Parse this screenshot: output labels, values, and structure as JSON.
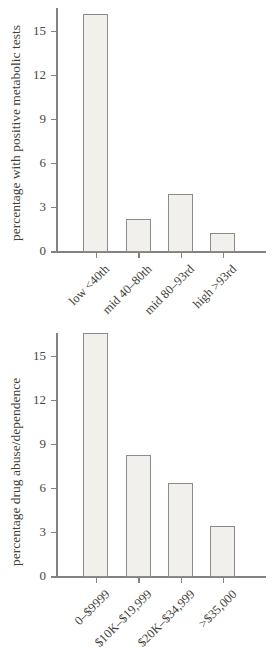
{
  "figure": {
    "background": "#ffffff",
    "text_color": "#413e37",
    "axis_color": "#84827e",
    "bar_fill": "#f1f0ed",
    "bar_border": "#8d8b87"
  },
  "chart_data": [
    {
      "type": "bar",
      "title": "",
      "xlabel": "",
      "ylabel": "percentage with positive metabolic tests",
      "categories": [
        "low <40th",
        "mid 40–80th",
        "mid 80–93rd",
        "high >93rd"
      ],
      "values": [
        16.1,
        2.2,
        3.9,
        1.2
      ],
      "yticks": [
        0,
        3,
        6,
        9,
        12,
        15
      ],
      "ylim": [
        0,
        16.5
      ],
      "grid": false,
      "legend": false
    },
    {
      "type": "bar",
      "title": "",
      "xlabel": "",
      "ylabel": "percentage drug abuse/dependence",
      "categories": [
        "0–$9999",
        "$10K–$19,999",
        "$20K–$34,999",
        ">$35,000"
      ],
      "values": [
        16.5,
        8.2,
        6.3,
        3.4
      ],
      "yticks": [
        0,
        3,
        6,
        9,
        12,
        15
      ],
      "ylim": [
        0,
        16.5
      ],
      "grid": false,
      "legend": false
    }
  ]
}
